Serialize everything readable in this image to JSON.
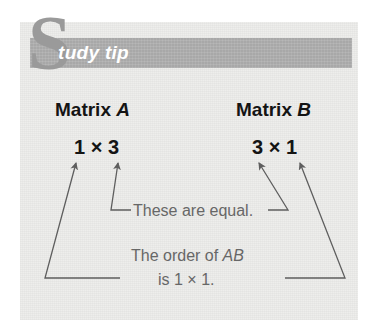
{
  "panel": {
    "background_color": "#eeeeec",
    "banner_color": "#a8a8a8"
  },
  "header": {
    "dropcap": "S",
    "title": "tudy tip",
    "full_title": "Study tip",
    "title_color": "#ffffff",
    "dropcap_color": "#9a9a9a"
  },
  "matrices": [
    {
      "label_prefix": "Matrix ",
      "label_name": "A",
      "rows": "1",
      "times": "×",
      "cols": "3",
      "dimensions": "1 × 3"
    },
    {
      "label_prefix": "Matrix ",
      "label_name": "B",
      "rows": "3",
      "times": "×",
      "cols": "1",
      "dimensions": "3 × 1"
    }
  ],
  "annotations": {
    "equal_note": "These are equal.",
    "order_line1_prefix": "The order of ",
    "order_line1_name": "AB",
    "order_line1": "The order of AB",
    "order_line2": "is 1 × 1.",
    "text_color": "#676767"
  }
}
